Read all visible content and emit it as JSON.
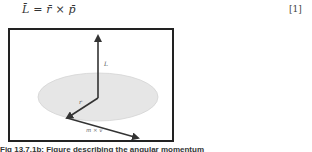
{
  "equation": {
    "text": "L̄ = r̄ × p̄",
    "number": "[1]"
  },
  "figure": {
    "labels": {
      "L": "L",
      "r": "r",
      "mv": "m × v"
    },
    "colors": {
      "border": "#222222",
      "disk": "#e6e6e6",
      "arrow": "#333333"
    }
  },
  "caption": {
    "text": "Fig 13.7.1b: Figure describing the angular momentum"
  }
}
